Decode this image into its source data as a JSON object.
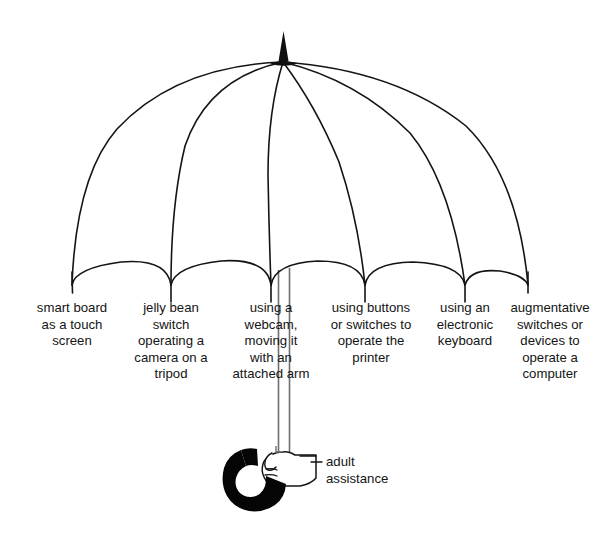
{
  "diagram": {
    "type": "umbrella-concept-diagram",
    "title": "",
    "ink_color": "#141414",
    "shaft_color": "#6e6e6e",
    "background_color": "#ffffff",
    "canopy": {
      "apex_x": 283,
      "apex_tip_y": 32,
      "hub_y": 62,
      "panels": 6,
      "rib_tips": [
        72,
        171,
        271,
        365,
        465,
        528
      ]
    },
    "handle": {
      "shape": "hook",
      "fill": "#000000",
      "hand": "fist-gripping-shaft"
    }
  },
  "branches": [
    {
      "id": "smart-board",
      "label": "smart board\nas a touch\nscreen",
      "rib_tip_x": 72,
      "center_x": 72
    },
    {
      "id": "jelly-bean-switch",
      "label": "jelly bean\nswitch\noperating a\ncamera on a\ntripod",
      "rib_tip_x": 171,
      "center_x": 171
    },
    {
      "id": "webcam",
      "label": "using a\nwebcam,\nmoving it\nwith an\nattached arm",
      "rib_tip_x": 271,
      "center_x": 271
    },
    {
      "id": "printer-buttons",
      "label": "using buttons\nor switches to\noperate the\nprinter",
      "rib_tip_x": 365,
      "center_x": 371
    },
    {
      "id": "electronic-keyboard",
      "label": "using an\nelectronic\nkeyboard",
      "rib_tip_x": 465,
      "center_x": 465
    },
    {
      "id": "augmentative-switches",
      "label": "augmentative\nswitches or\ndevices to\noperate a\ncomputer",
      "rib_tip_x": 528,
      "center_x": 549
    }
  ],
  "handle_annotation": {
    "id": "adult-assistance",
    "label": "adult\nassistance"
  }
}
